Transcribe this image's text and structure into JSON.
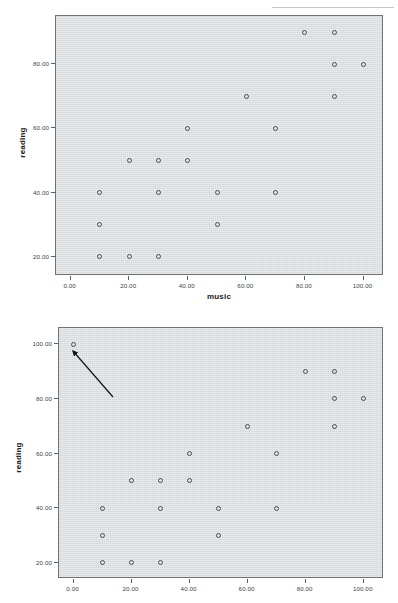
{
  "page": {
    "background_color": "#ffffff",
    "artifact_text": "",
    "plot_bg_color": "#dcdfe1",
    "frame_color": "#6d7278",
    "marker_color": "#4a4f56"
  },
  "charts": [
    {
      "id": "scatter-music-reading-without-outlier",
      "title": "",
      "xlabel": "music",
      "ylabel": "reading",
      "x_ticklabels": [
        "0.00",
        "20.00",
        "40.00",
        "60.00",
        "80.00",
        "100.00"
      ],
      "y_ticklabels": [
        "20.00",
        "40.00",
        "60.00",
        "80.00"
      ]
    },
    {
      "id": "scatter-music-reading-with-outlier",
      "title": "",
      "xlabel": "",
      "ylabel": "reading",
      "x_ticklabels": [
        "0.00",
        "20.00",
        "40.00",
        "60.00",
        "80.00",
        "100.00"
      ],
      "y_ticklabels": [
        "20.00",
        "40.00",
        "60.00",
        "80.00",
        "100.00"
      ],
      "annotation": {
        "type": "arrow",
        "points_to": "outlier at music=0, reading=100",
        "label": ""
      }
    }
  ],
  "chart_data": [
    {
      "type": "scatter",
      "title": "",
      "xlabel": "music",
      "ylabel": "reading",
      "xlim": [
        -5,
        107
      ],
      "ylim": [
        14,
        95
      ],
      "x_ticks": [
        0,
        20,
        40,
        60,
        80,
        100
      ],
      "y_ticks": [
        20,
        40,
        60,
        80
      ],
      "x_ticklabels": [
        "0.00",
        "20.00",
        "40.00",
        "60.00",
        "80.00",
        "100.00"
      ],
      "y_ticklabels": [
        "20.00",
        "40.00",
        "60.00",
        "80.00"
      ],
      "grid": false,
      "legend": false,
      "marker": "open-circle",
      "points": [
        {
          "x": 10,
          "y": 20
        },
        {
          "x": 20,
          "y": 20
        },
        {
          "x": 30,
          "y": 20
        },
        {
          "x": 10,
          "y": 30
        },
        {
          "x": 50,
          "y": 30
        },
        {
          "x": 10,
          "y": 40
        },
        {
          "x": 30,
          "y": 40
        },
        {
          "x": 50,
          "y": 40
        },
        {
          "x": 70,
          "y": 40
        },
        {
          "x": 20,
          "y": 50
        },
        {
          "x": 30,
          "y": 50
        },
        {
          "x": 40,
          "y": 50
        },
        {
          "x": 40,
          "y": 60
        },
        {
          "x": 70,
          "y": 60
        },
        {
          "x": 60,
          "y": 70
        },
        {
          "x": 90,
          "y": 70
        },
        {
          "x": 90,
          "y": 80
        },
        {
          "x": 100,
          "y": 80
        },
        {
          "x": 80,
          "y": 90
        },
        {
          "x": 90,
          "y": 90
        }
      ]
    },
    {
      "type": "scatter",
      "title": "",
      "xlabel": "",
      "ylabel": "reading",
      "xlim": [
        -5,
        107
      ],
      "ylim": [
        14,
        106
      ],
      "x_ticks": [
        0,
        20,
        40,
        60,
        80,
        100
      ],
      "y_ticks": [
        20,
        40,
        60,
        80,
        100
      ],
      "x_ticklabels": [
        "0.00",
        "20.00",
        "40.00",
        "60.00",
        "80.00",
        "100.00"
      ],
      "y_ticklabels": [
        "20.00",
        "40.00",
        "60.00",
        "80.00",
        "100.00"
      ],
      "grid": false,
      "legend": false,
      "marker": "open-circle",
      "points": [
        {
          "x": 0,
          "y": 100
        },
        {
          "x": 10,
          "y": 20
        },
        {
          "x": 20,
          "y": 20
        },
        {
          "x": 30,
          "y": 20
        },
        {
          "x": 10,
          "y": 30
        },
        {
          "x": 50,
          "y": 30
        },
        {
          "x": 10,
          "y": 40
        },
        {
          "x": 30,
          "y": 40
        },
        {
          "x": 50,
          "y": 40
        },
        {
          "x": 70,
          "y": 40
        },
        {
          "x": 20,
          "y": 50
        },
        {
          "x": 30,
          "y": 50
        },
        {
          "x": 40,
          "y": 50
        },
        {
          "x": 40,
          "y": 60
        },
        {
          "x": 70,
          "y": 60
        },
        {
          "x": 60,
          "y": 70
        },
        {
          "x": 90,
          "y": 70
        },
        {
          "x": 90,
          "y": 80
        },
        {
          "x": 100,
          "y": 80
        },
        {
          "x": 80,
          "y": 90
        },
        {
          "x": 90,
          "y": 90
        }
      ],
      "annotations": [
        {
          "type": "arrow",
          "from": {
            "x": 17,
            "y": 83
          },
          "to": {
            "x": 2.5,
            "y": 97.5
          }
        }
      ]
    }
  ]
}
